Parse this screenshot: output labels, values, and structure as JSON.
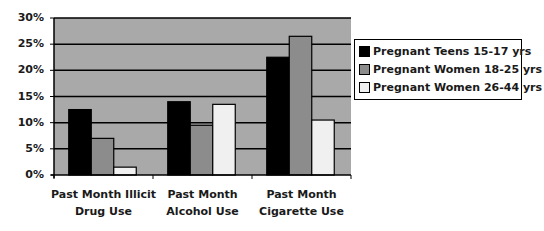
{
  "chart_data": {
    "type": "bar",
    "title": "",
    "xlabel": "",
    "ylabel": "",
    "ylim": [
      0,
      30
    ],
    "yticks": [
      "0%",
      "5%",
      "10%",
      "15%",
      "20%",
      "25%",
      "30%"
    ],
    "grid": true,
    "legend_position": "right",
    "categories": [
      "Past Month Illicit Drug Use",
      "Past Month Alcohol Use",
      "Past Month Cigarette Use"
    ],
    "category_lines": [
      [
        "Past Month Illicit",
        "Drug Use"
      ],
      [
        "Past Month",
        "Alcohol Use"
      ],
      [
        "Past Month",
        "Cigarette Use"
      ]
    ],
    "series": [
      {
        "name": "Pregnant Teens 15-17 yrs",
        "color": "#000000",
        "values": [
          12.5,
          14.0,
          22.5
        ]
      },
      {
        "name": "Pregnant Women 18-25 yrs",
        "color": "#8c8c8c",
        "values": [
          7.0,
          9.5,
          26.5
        ]
      },
      {
        "name": "Pregnant Women 26-44 yrs",
        "color": "#f0f0f0",
        "values": [
          1.5,
          13.5,
          10.5
        ]
      }
    ],
    "plot_background": "#a9a9a9"
  }
}
